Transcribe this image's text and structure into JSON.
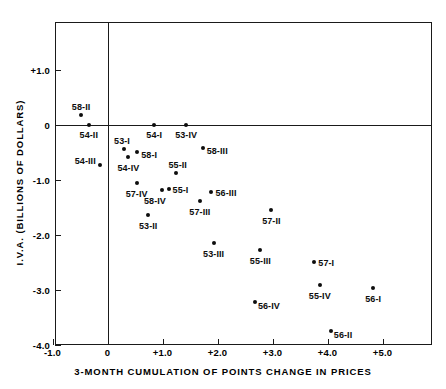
{
  "chart_data": {
    "type": "scatter",
    "title": "",
    "xlabel": "3-MONTH CUMULATION OF POINTS CHANGE IN PRICES",
    "ylabel": "I.V.A. (BILLIONS OF DOLLARS)",
    "xlim": [
      -1.0,
      5.85
    ],
    "ylim": [
      -4.0,
      1.4
    ],
    "grid": false,
    "legend": "none",
    "xticks": [
      "-1.0",
      "0",
      "+1.0",
      "+2.0",
      "+3.0",
      "+4.0",
      "+5.0"
    ],
    "xtick_values": [
      -1.0,
      0,
      1.0,
      2.0,
      3.0,
      4.0,
      5.0
    ],
    "yticks": [
      "+1.0",
      "0",
      "-1.0",
      "-2.0",
      "-3.0",
      "-4.0"
    ],
    "ytick_values": [
      1.0,
      0,
      -1.0,
      -2.0,
      -3.0,
      -4.0
    ],
    "points": [
      {
        "label": "58-II",
        "x": -0.48,
        "y": 0.18,
        "lpos": "above",
        "ldx": 0,
        "ldy": -3
      },
      {
        "label": "54-II",
        "x": -0.34,
        "y": 0.0,
        "lpos": "below",
        "ldx": 0,
        "ldy": 5
      },
      {
        "label": "54-III",
        "x": -0.14,
        "y": -0.73,
        "lpos": "left",
        "ldx": -4,
        "ldy": -4
      },
      {
        "label": "54-I",
        "x": 0.85,
        "y": 0.0,
        "lpos": "below",
        "ldx": 0,
        "ldy": 5
      },
      {
        "label": "53-IV",
        "x": 1.43,
        "y": 0.0,
        "lpos": "below",
        "ldx": 0,
        "ldy": 5
      },
      {
        "label": "53-I",
        "x": 0.3,
        "y": -0.44,
        "lpos": "above",
        "ldx": -2,
        "ldy": -3
      },
      {
        "label": "58-I",
        "x": 0.54,
        "y": -0.49,
        "lpos": "right",
        "ldx": 4,
        "ldy": 3
      },
      {
        "label": "58-III",
        "x": 1.73,
        "y": -0.42,
        "lpos": "right",
        "ldx": 4,
        "ldy": 3
      },
      {
        "label": "54-IV",
        "x": 0.38,
        "y": -0.58,
        "lpos": "below",
        "ldx": 0,
        "ldy": 6
      },
      {
        "label": "55-II",
        "x": 1.24,
        "y": -0.87,
        "lpos": "above",
        "ldx": 2,
        "ldy": -3
      },
      {
        "label": "57-IV",
        "x": 0.53,
        "y": -1.05,
        "lpos": "below",
        "ldx": 0,
        "ldy": 6
      },
      {
        "label": "55-I",
        "x": 1.11,
        "y": -1.16,
        "lpos": "right",
        "ldx": 4,
        "ldy": 1
      },
      {
        "label": "58-IV",
        "x": 0.99,
        "y": -1.18,
        "lpos": "below",
        "ldx": -7,
        "ldy": 6
      },
      {
        "label": "56-III",
        "x": 1.89,
        "y": -1.22,
        "lpos": "right",
        "ldx": 4,
        "ldy": 1
      },
      {
        "label": "57-III",
        "x": 1.68,
        "y": -1.38,
        "lpos": "below",
        "ldx": 0,
        "ldy": 6
      },
      {
        "label": "53-II",
        "x": 0.74,
        "y": -1.64,
        "lpos": "below",
        "ldx": 0,
        "ldy": 6
      },
      {
        "label": "57-II",
        "x": 2.98,
        "y": -1.55,
        "lpos": "below",
        "ldx": 0,
        "ldy": 6
      },
      {
        "label": "53-III",
        "x": 1.93,
        "y": -2.15,
        "lpos": "below",
        "ldx": 0,
        "ldy": 6
      },
      {
        "label": "55-III",
        "x": 2.78,
        "y": -2.28,
        "lpos": "below",
        "ldx": 0,
        "ldy": 6
      },
      {
        "label": "57-I",
        "x": 3.76,
        "y": -2.49,
        "lpos": "right",
        "ldx": 4,
        "ldy": 1
      },
      {
        "label": "55-IV",
        "x": 3.86,
        "y": -2.91,
        "lpos": "below",
        "ldx": 0,
        "ldy": 6
      },
      {
        "label": "56-I",
        "x": 4.83,
        "y": -2.96,
        "lpos": "below",
        "ldx": 0,
        "ldy": 6
      },
      {
        "label": "56-IV",
        "x": 2.68,
        "y": -3.22,
        "lpos": "right",
        "ldx": 3,
        "ldy": 4
      },
      {
        "label": "56-II",
        "x": 4.06,
        "y": -3.75,
        "lpos": "right",
        "ldx": 3,
        "ldy": 4
      }
    ]
  }
}
